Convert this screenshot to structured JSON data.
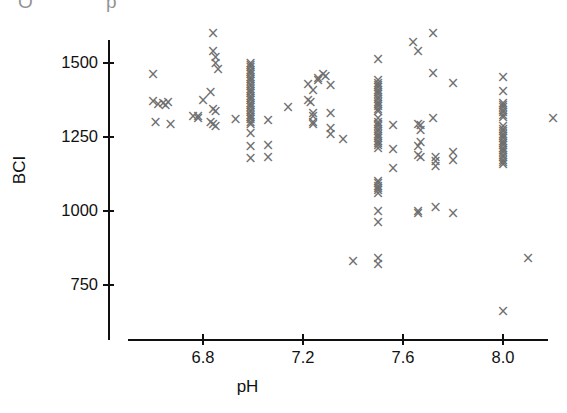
{
  "figure": {
    "artifact_text": "O p",
    "marker_glyph": "×",
    "marker_color": "#6f6f6f",
    "axis_color": "#101010",
    "background": "#ffffff"
  },
  "chart_data": {
    "type": "scatter",
    "title": "",
    "xlabel": "pH",
    "ylabel": "BCI",
    "xlim": [
      6.5,
      8.25
    ],
    "ylim": [
      620,
      1620
    ],
    "grid": false,
    "legend": null,
    "xticks": [
      6.8,
      7.2,
      7.6,
      8.0
    ],
    "xtick_labels": [
      "6.8",
      "7.2",
      "7.6",
      "8.0"
    ],
    "yticks": [
      750,
      1000,
      1250,
      1500
    ],
    "ytick_labels": [
      "750",
      "1000",
      "1250",
      "1500"
    ],
    "marker": "x",
    "series": [
      {
        "name": "BCI vs pH",
        "points": [
          [
            6.6,
            1460
          ],
          [
            6.6,
            1370
          ],
          [
            6.62,
            1360
          ],
          [
            6.64,
            1362
          ],
          [
            6.65,
            1358
          ],
          [
            6.66,
            1366
          ],
          [
            6.61,
            1300
          ],
          [
            6.67,
            1292
          ],
          [
            6.76,
            1318
          ],
          [
            6.78,
            1312
          ],
          [
            6.84,
            1600
          ],
          [
            6.84,
            1540
          ],
          [
            6.85,
            1520
          ],
          [
            6.85,
            1498
          ],
          [
            6.86,
            1478
          ],
          [
            6.83,
            1400
          ],
          [
            6.8,
            1372
          ],
          [
            6.84,
            1342
          ],
          [
            6.85,
            1336
          ],
          [
            6.83,
            1300
          ],
          [
            6.84,
            1292
          ],
          [
            6.85,
            1286
          ],
          [
            6.78,
            1318
          ],
          [
            6.93,
            1310
          ],
          [
            6.99,
            1500
          ],
          [
            6.99,
            1492
          ],
          [
            6.99,
            1484
          ],
          [
            6.99,
            1476
          ],
          [
            6.99,
            1468
          ],
          [
            6.99,
            1460
          ],
          [
            6.99,
            1452
          ],
          [
            6.99,
            1444
          ],
          [
            6.99,
            1436
          ],
          [
            6.99,
            1428
          ],
          [
            6.99,
            1420
          ],
          [
            6.99,
            1412
          ],
          [
            6.99,
            1404
          ],
          [
            6.99,
            1396
          ],
          [
            6.99,
            1388
          ],
          [
            6.99,
            1380
          ],
          [
            6.99,
            1372
          ],
          [
            6.99,
            1364
          ],
          [
            6.99,
            1356
          ],
          [
            6.99,
            1348
          ],
          [
            6.99,
            1340
          ],
          [
            6.99,
            1332
          ],
          [
            6.99,
            1324
          ],
          [
            6.99,
            1316
          ],
          [
            6.99,
            1308
          ],
          [
            6.99,
            1300
          ],
          [
            6.99,
            1292
          ],
          [
            6.99,
            1262
          ],
          [
            6.99,
            1218
          ],
          [
            6.99,
            1178
          ],
          [
            7.06,
            1306
          ],
          [
            7.06,
            1222
          ],
          [
            7.06,
            1182
          ],
          [
            7.14,
            1348
          ],
          [
            7.22,
            1428
          ],
          [
            7.24,
            1408
          ],
          [
            7.22,
            1372
          ],
          [
            7.23,
            1366
          ],
          [
            7.26,
            1440
          ],
          [
            7.26,
            1446
          ],
          [
            7.28,
            1462
          ],
          [
            7.29,
            1456
          ],
          [
            7.24,
            1328
          ],
          [
            7.24,
            1320
          ],
          [
            7.24,
            1300
          ],
          [
            7.24,
            1292
          ],
          [
            7.31,
            1424
          ],
          [
            7.31,
            1328
          ],
          [
            7.31,
            1278
          ],
          [
            7.31,
            1258
          ],
          [
            7.36,
            1240
          ],
          [
            7.4,
            830
          ],
          [
            7.5,
            1512
          ],
          [
            7.5,
            1440
          ],
          [
            7.5,
            1432
          ],
          [
            7.5,
            1424
          ],
          [
            7.5,
            1416
          ],
          [
            7.5,
            1408
          ],
          [
            7.5,
            1400
          ],
          [
            7.5,
            1392
          ],
          [
            7.5,
            1384
          ],
          [
            7.5,
            1376
          ],
          [
            7.5,
            1368
          ],
          [
            7.5,
            1360
          ],
          [
            7.5,
            1352
          ],
          [
            7.5,
            1344
          ],
          [
            7.5,
            1336
          ],
          [
            7.5,
            1312
          ],
          [
            7.5,
            1300
          ],
          [
            7.5,
            1292
          ],
          [
            7.5,
            1284
          ],
          [
            7.5,
            1276
          ],
          [
            7.5,
            1268
          ],
          [
            7.5,
            1260
          ],
          [
            7.5,
            1252
          ],
          [
            7.5,
            1244
          ],
          [
            7.5,
            1236
          ],
          [
            7.5,
            1228
          ],
          [
            7.5,
            1220
          ],
          [
            7.5,
            1212
          ],
          [
            7.5,
            1100
          ],
          [
            7.5,
            1092
          ],
          [
            7.5,
            1084
          ],
          [
            7.5,
            1076
          ],
          [
            7.5,
            1068
          ],
          [
            7.5,
            1060
          ],
          [
            7.5,
            1000
          ],
          [
            7.5,
            960
          ],
          [
            7.5,
            840
          ],
          [
            7.5,
            820
          ],
          [
            7.56,
            1290
          ],
          [
            7.56,
            1208
          ],
          [
            7.56,
            1142
          ],
          [
            7.64,
            1568
          ],
          [
            7.66,
            1538
          ],
          [
            7.66,
            1292
          ],
          [
            7.67,
            1288
          ],
          [
            7.67,
            1272
          ],
          [
            7.67,
            1230
          ],
          [
            7.66,
            1218
          ],
          [
            7.66,
            1188
          ],
          [
            7.67,
            1182
          ],
          [
            7.66,
            1000
          ],
          [
            7.66,
            990
          ],
          [
            7.72,
            1598
          ],
          [
            7.72,
            1464
          ],
          [
            7.72,
            1312
          ],
          [
            7.73,
            1180
          ],
          [
            7.73,
            1166
          ],
          [
            7.73,
            1150
          ],
          [
            7.73,
            1012
          ],
          [
            7.8,
            1430
          ],
          [
            7.8,
            1198
          ],
          [
            7.8,
            1172
          ],
          [
            7.8,
            990
          ],
          [
            8.0,
            1452
          ],
          [
            8.0,
            1404
          ],
          [
            8.0,
            1364
          ],
          [
            8.0,
            1356
          ],
          [
            8.0,
            1348
          ],
          [
            8.0,
            1340
          ],
          [
            8.0,
            1332
          ],
          [
            8.0,
            1324
          ],
          [
            8.0,
            1316
          ],
          [
            8.0,
            1284
          ],
          [
            8.0,
            1276
          ],
          [
            8.0,
            1268
          ],
          [
            8.0,
            1260
          ],
          [
            8.0,
            1252
          ],
          [
            8.0,
            1244
          ],
          [
            8.0,
            1236
          ],
          [
            8.0,
            1228
          ],
          [
            8.0,
            1220
          ],
          [
            8.0,
            1212
          ],
          [
            8.0,
            1204
          ],
          [
            8.0,
            1196
          ],
          [
            8.0,
            1188
          ],
          [
            8.0,
            1180
          ],
          [
            8.0,
            1172
          ],
          [
            8.0,
            1164
          ],
          [
            8.0,
            1156
          ],
          [
            8.0,
            660
          ],
          [
            8.1,
            840
          ],
          [
            8.2,
            1312
          ]
        ]
      }
    ]
  }
}
